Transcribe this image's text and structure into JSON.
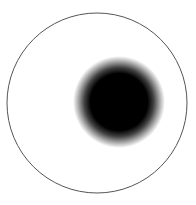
{
  "figure": {
    "outer_circle": {
      "cx": 97,
      "cy": 103,
      "r": 90,
      "stroke": "#555555",
      "stroke_width": 1
    },
    "dot": {
      "cx": 119,
      "cy": 102,
      "core_r": 30,
      "halo_r": 46,
      "color": "#000000"
    }
  }
}
